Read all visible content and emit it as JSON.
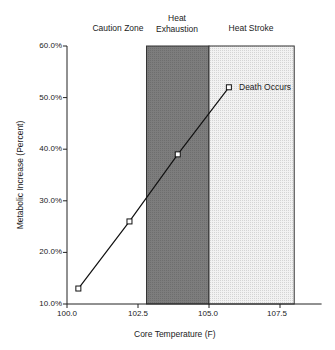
{
  "chart_data": {
    "type": "line",
    "title": "",
    "xlabel": "Core Temperature (F)",
    "ylabel": "Metabolic Increase (Percent)",
    "xlim": [
      100.0,
      109.0
    ],
    "ylim": [
      10.0,
      60.0
    ],
    "x_ticks": [
      "100.0",
      "102.5",
      "105.0",
      "107.5"
    ],
    "y_ticks": [
      "10.0%",
      "20.0%",
      "30.0%",
      "40.0%",
      "50.0%",
      "60.0%"
    ],
    "grid": false,
    "legend": null,
    "series": [
      {
        "name": "Metabolic Increase",
        "marker": "open-square",
        "x": [
          100.4,
          102.2,
          103.9,
          105.7
        ],
        "y": [
          13,
          26,
          39,
          52
        ]
      }
    ],
    "zones": [
      {
        "label": "Caution Zone",
        "x_start": 100.0,
        "x_end": 102.8,
        "fill": "none"
      },
      {
        "label": "Heat Exhaustion",
        "x_start": 102.8,
        "x_end": 105.0,
        "fill": "#7a7a7a"
      },
      {
        "label": "Heat Stroke",
        "x_start": 105.0,
        "x_end": 108.0,
        "fill": "#e8e8e8"
      }
    ],
    "annotations": [
      {
        "text": "Death Occurs",
        "x": 105.7,
        "y": 52
      }
    ]
  },
  "labels": {
    "zone_caution": "Caution Zone",
    "zone_exhaustion_line1": "Heat",
    "zone_exhaustion_line2": "Exhaustion",
    "zone_stroke": "Heat Stroke",
    "annotation": "Death Occurs",
    "xlabel": "Core Temperature (F)",
    "ylabel": "Metabolic Increase (Percent)",
    "yticks": [
      "60.0%",
      "50.0%",
      "40.0%",
      "30.0%",
      "20.0%",
      "10.0%"
    ],
    "xticks": [
      "100.0",
      "102.5",
      "105.0",
      "107.5"
    ]
  },
  "colors": {
    "exhaustion_fill": "#7a7a7a",
    "stroke_fill": "#e8e8e8",
    "axis": "#222222",
    "line": "#111111"
  }
}
